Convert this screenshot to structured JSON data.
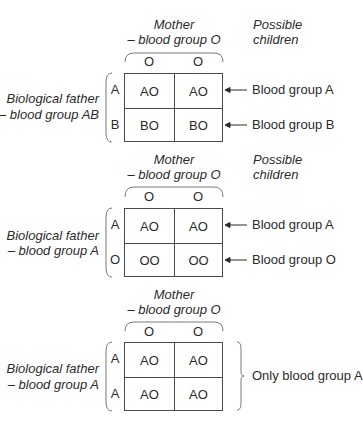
{
  "diagram": {
    "colors": {
      "text": "#2b2b2b",
      "lines": "#4a4a4a"
    },
    "panels": [
      {
        "mother_label": [
          "Mother",
          "– blood group O"
        ],
        "possible_children_label": [
          "Possible",
          "children"
        ],
        "mother_alleles": [
          "O",
          "O"
        ],
        "father_label": [
          "Biological father",
          "– blood group AB"
        ],
        "father_alleles": [
          "A",
          "B"
        ],
        "cells": [
          [
            "AO",
            "AO"
          ],
          [
            "BO",
            "BO"
          ]
        ],
        "outcomes": [
          "Blood group A",
          "Blood group B"
        ],
        "outcome_style": "arrows"
      },
      {
        "mother_label": [
          "Mother",
          "– blood group O"
        ],
        "possible_children_label": [
          "Possible",
          "children"
        ],
        "mother_alleles": [
          "O",
          "O"
        ],
        "father_label": [
          "Biological father",
          "– blood group A"
        ],
        "father_alleles": [
          "A",
          "O"
        ],
        "cells": [
          [
            "AO",
            "AO"
          ],
          [
            "OO",
            "OO"
          ]
        ],
        "outcomes": [
          "Blood group A",
          "Blood group O"
        ],
        "outcome_style": "arrows"
      },
      {
        "mother_label": [
          "Mother",
          "– blood group O"
        ],
        "mother_alleles": [
          "O",
          "O"
        ],
        "father_label": [
          "Biological father",
          "– blood group A"
        ],
        "father_alleles": [
          "A",
          "A"
        ],
        "cells": [
          [
            "AO",
            "AO"
          ],
          [
            "AO",
            "AO"
          ]
        ],
        "outcomes": [
          "Only blood group A"
        ],
        "outcome_style": "brace"
      }
    ]
  }
}
